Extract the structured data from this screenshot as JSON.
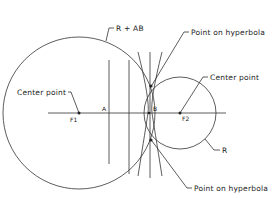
{
  "diagram": {
    "labels": {
      "r_plus_ab": "R + AB",
      "point_on_hyperbola_top": "Point on hyperbola",
      "center_point_left": "Center point",
      "center_point_right": "Center point",
      "r": "R",
      "point_on_hyperbola_bottom": "Point on hyperbola",
      "f1": "F1",
      "f2": "F2",
      "a": "A",
      "b": "B"
    },
    "colors": {
      "stroke": "#333333",
      "background": "#ffffff"
    }
  }
}
